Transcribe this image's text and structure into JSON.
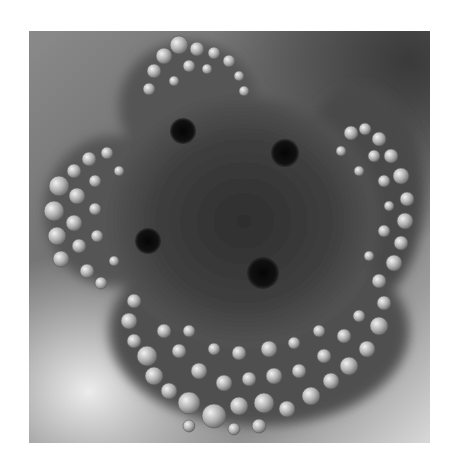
{
  "image": {
    "description": "Grayscale DIC microscopy photograph of a four-lobed cell with granular vesicle-filled periphery and four dark spherical bodies",
    "colors": {
      "background_frame": "#ffffff",
      "dark_cytoplasm": "#3c3c3c",
      "vesicle_highlight": "#e6e6e6",
      "dark_body": "#0a0a0a"
    },
    "dark_bodies": [
      {
        "cx": 154,
        "cy": 100,
        "r": 13
      },
      {
        "cx": 256,
        "cy": 122,
        "r": 14
      },
      {
        "cx": 119,
        "cy": 210,
        "r": 13
      },
      {
        "cx": 234,
        "cy": 242,
        "r": 16
      }
    ]
  }
}
